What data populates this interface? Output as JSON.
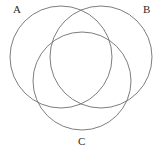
{
  "figure": {
    "kind": "venn-diagram",
    "background_color": "#ffffff",
    "stroke_color": "#6e6e6e",
    "label_color": "#2b2b2b",
    "canvas": {
      "width": 161,
      "height": 151
    }
  },
  "sets": [
    {
      "id": "A",
      "label": "A",
      "label_position": "top-left",
      "circle": {
        "cx": 61,
        "cy": 57,
        "r": 51
      }
    },
    {
      "id": "B",
      "label": "B",
      "label_position": "top-right",
      "circle": {
        "cx": 101,
        "cy": 57,
        "r": 51
      }
    },
    {
      "id": "C",
      "label": "C",
      "label_position": "bottom-center",
      "circle": {
        "cx": 82,
        "cy": 81,
        "r": 49
      }
    }
  ]
}
